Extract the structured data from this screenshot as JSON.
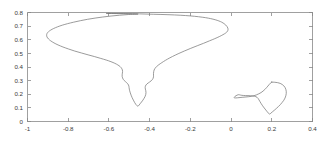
{
  "figure": {
    "background_color": "#ffffff",
    "axis_color": "#888888",
    "curve_color": "#7a7a7a",
    "tick_label_color": "#3a3a3a"
  },
  "chart_data": {
    "type": "line",
    "title": "",
    "subtitle": "",
    "xlabel": "",
    "ylabel": "",
    "xlim": [
      -1,
      0.4
    ],
    "ylim": [
      0,
      0.8
    ],
    "grid": false,
    "legend": null,
    "xticks": [
      -1,
      -0.8,
      -0.6,
      -0.4,
      -0.2,
      0,
      0.2,
      0.4
    ],
    "xtick_labels": [
      "-1",
      "-0.8",
      "-0.6",
      "-0.4",
      "-0.2",
      "0",
      "0.2",
      "0.4"
    ],
    "yticks": [
      0,
      0.1,
      0.2,
      0.3,
      0.4,
      0.5,
      0.6,
      0.7,
      0.8
    ],
    "ytick_labels": [
      "0",
      "0.1",
      "0.2",
      "0.3",
      "0.4",
      "0.5",
      "0.6",
      "0.7",
      "0.8"
    ],
    "series": [
      {
        "name": "large-contour",
        "closed": true,
        "points": [
          [
            -0.6,
            0.793
          ],
          [
            -0.52,
            0.792
          ],
          [
            -0.45,
            0.79
          ],
          [
            -0.38,
            0.787
          ],
          [
            -0.31,
            0.784
          ],
          [
            -0.25,
            0.78
          ],
          [
            -0.2,
            0.775
          ],
          [
            -0.16,
            0.769
          ],
          [
            -0.125,
            0.762
          ],
          [
            -0.1,
            0.755
          ],
          [
            -0.078,
            0.747
          ],
          [
            -0.06,
            0.738
          ],
          [
            -0.046,
            0.729
          ],
          [
            -0.035,
            0.719
          ],
          [
            -0.026,
            0.708
          ],
          [
            -0.02,
            0.697
          ],
          [
            -0.016,
            0.686
          ],
          [
            -0.015,
            0.674
          ],
          [
            -0.018,
            0.662
          ],
          [
            -0.026,
            0.65
          ],
          [
            -0.04,
            0.637
          ],
          [
            -0.058,
            0.623
          ],
          [
            -0.08,
            0.608
          ],
          [
            -0.106,
            0.592
          ],
          [
            -0.135,
            0.574
          ],
          [
            -0.166,
            0.556
          ],
          [
            -0.198,
            0.537
          ],
          [
            -0.23,
            0.517
          ],
          [
            -0.26,
            0.497
          ],
          [
            -0.288,
            0.477
          ],
          [
            -0.312,
            0.458
          ],
          [
            -0.332,
            0.44
          ],
          [
            -0.348,
            0.424
          ],
          [
            -0.36,
            0.411
          ],
          [
            -0.368,
            0.4
          ],
          [
            -0.374,
            0.389
          ],
          [
            -0.378,
            0.378
          ],
          [
            -0.38,
            0.366
          ],
          [
            -0.381,
            0.353
          ],
          [
            -0.381,
            0.34
          ],
          [
            -0.381,
            0.328
          ],
          [
            -0.383,
            0.317
          ],
          [
            -0.387,
            0.307
          ],
          [
            -0.393,
            0.298
          ],
          [
            -0.4,
            0.29
          ],
          [
            -0.407,
            0.283
          ],
          [
            -0.413,
            0.276
          ],
          [
            -0.418,
            0.268
          ],
          [
            -0.421,
            0.259
          ],
          [
            -0.422,
            0.249
          ],
          [
            -0.421,
            0.238
          ],
          [
            -0.419,
            0.226
          ],
          [
            -0.418,
            0.213
          ],
          [
            -0.419,
            0.199
          ],
          [
            -0.422,
            0.185
          ],
          [
            -0.427,
            0.171
          ],
          [
            -0.433,
            0.157
          ],
          [
            -0.44,
            0.143
          ],
          [
            -0.447,
            0.13
          ],
          [
            -0.452,
            0.12
          ],
          [
            -0.456,
            0.114
          ],
          [
            -0.459,
            0.113
          ],
          [
            -0.463,
            0.117
          ],
          [
            -0.468,
            0.126
          ],
          [
            -0.474,
            0.14
          ],
          [
            -0.48,
            0.157
          ],
          [
            -0.486,
            0.175
          ],
          [
            -0.491,
            0.193
          ],
          [
            -0.495,
            0.21
          ],
          [
            -0.498,
            0.225
          ],
          [
            -0.5,
            0.238
          ],
          [
            -0.501,
            0.249
          ],
          [
            -0.502,
            0.259
          ],
          [
            -0.504,
            0.268
          ],
          [
            -0.508,
            0.277
          ],
          [
            -0.513,
            0.285
          ],
          [
            -0.519,
            0.293
          ],
          [
            -0.525,
            0.301
          ],
          [
            -0.53,
            0.31
          ],
          [
            -0.533,
            0.32
          ],
          [
            -0.535,
            0.331
          ],
          [
            -0.535,
            0.343
          ],
          [
            -0.534,
            0.355
          ],
          [
            -0.533,
            0.367
          ],
          [
            -0.534,
            0.379
          ],
          [
            -0.538,
            0.391
          ],
          [
            -0.545,
            0.403
          ],
          [
            -0.556,
            0.415
          ],
          [
            -0.571,
            0.427
          ],
          [
            -0.59,
            0.439
          ],
          [
            -0.613,
            0.451
          ],
          [
            -0.64,
            0.463
          ],
          [
            -0.67,
            0.476
          ],
          [
            -0.702,
            0.489
          ],
          [
            -0.735,
            0.503
          ],
          [
            -0.768,
            0.517
          ],
          [
            -0.798,
            0.532
          ],
          [
            -0.826,
            0.547
          ],
          [
            -0.85,
            0.562
          ],
          [
            -0.87,
            0.577
          ],
          [
            -0.886,
            0.592
          ],
          [
            -0.897,
            0.606
          ],
          [
            -0.904,
            0.62
          ],
          [
            -0.906,
            0.633
          ],
          [
            -0.904,
            0.646
          ],
          [
            -0.897,
            0.659
          ],
          [
            -0.886,
            0.671
          ],
          [
            -0.871,
            0.683
          ],
          [
            -0.852,
            0.695
          ],
          [
            -0.829,
            0.707
          ],
          [
            -0.803,
            0.718
          ],
          [
            -0.773,
            0.729
          ],
          [
            -0.74,
            0.74
          ],
          [
            -0.705,
            0.75
          ],
          [
            -0.668,
            0.759
          ],
          [
            -0.63,
            0.767
          ],
          [
            -0.59,
            0.774
          ],
          [
            -0.548,
            0.78
          ],
          [
            -0.505,
            0.785
          ],
          [
            -0.46,
            0.789
          ],
          [
            -0.6,
            0.793
          ]
        ]
      },
      {
        "name": "small-contour",
        "closed": true,
        "points": [
          [
            0.2,
            0.289
          ],
          [
            0.215,
            0.288
          ],
          [
            0.229,
            0.285
          ],
          [
            0.241,
            0.28
          ],
          [
            0.251,
            0.272
          ],
          [
            0.259,
            0.262
          ],
          [
            0.265,
            0.25
          ],
          [
            0.269,
            0.236
          ],
          [
            0.271,
            0.221
          ],
          [
            0.271,
            0.205
          ],
          [
            0.269,
            0.189
          ],
          [
            0.265,
            0.172
          ],
          [
            0.259,
            0.156
          ],
          [
            0.251,
            0.14
          ],
          [
            0.242,
            0.124
          ],
          [
            0.232,
            0.109
          ],
          [
            0.222,
            0.095
          ],
          [
            0.212,
            0.082
          ],
          [
            0.203,
            0.071
          ],
          [
            0.196,
            0.062
          ],
          [
            0.192,
            0.056
          ],
          [
            0.19,
            0.053
          ],
          [
            0.188,
            0.055
          ],
          [
            0.184,
            0.061
          ],
          [
            0.178,
            0.071
          ],
          [
            0.171,
            0.084
          ],
          [
            0.163,
            0.099
          ],
          [
            0.155,
            0.115
          ],
          [
            0.148,
            0.131
          ],
          [
            0.142,
            0.146
          ],
          [
            0.137,
            0.159
          ],
          [
            0.133,
            0.169
          ],
          [
            0.128,
            0.177
          ],
          [
            0.122,
            0.182
          ],
          [
            0.114,
            0.186
          ],
          [
            0.105,
            0.188
          ],
          [
            0.094,
            0.189
          ],
          [
            0.083,
            0.19
          ],
          [
            0.072,
            0.19
          ],
          [
            0.062,
            0.191
          ],
          [
            0.053,
            0.192
          ],
          [
            0.046,
            0.194
          ],
          [
            0.041,
            0.196
          ],
          [
            0.038,
            0.197
          ],
          [
            0.034,
            0.196
          ],
          [
            0.029,
            0.193
          ],
          [
            0.024,
            0.189
          ],
          [
            0.019,
            0.184
          ],
          [
            0.016,
            0.179
          ],
          [
            0.015,
            0.175
          ],
          [
            0.017,
            0.173
          ],
          [
            0.023,
            0.173
          ],
          [
            0.032,
            0.174
          ],
          [
            0.044,
            0.176
          ],
          [
            0.058,
            0.178
          ],
          [
            0.073,
            0.18
          ],
          [
            0.087,
            0.182
          ],
          [
            0.1,
            0.185
          ],
          [
            0.112,
            0.189
          ],
          [
            0.124,
            0.195
          ],
          [
            0.136,
            0.203
          ],
          [
            0.147,
            0.212
          ],
          [
            0.157,
            0.223
          ],
          [
            0.166,
            0.235
          ],
          [
            0.174,
            0.248
          ],
          [
            0.181,
            0.26
          ],
          [
            0.187,
            0.271
          ],
          [
            0.193,
            0.281
          ],
          [
            0.2,
            0.289
          ]
        ]
      }
    ]
  }
}
